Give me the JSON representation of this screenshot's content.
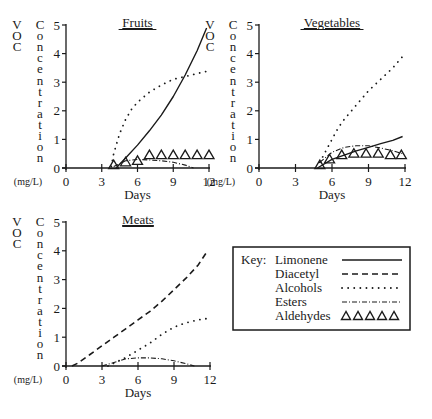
{
  "figure": {
    "ylabel_word1": [
      "V",
      "O",
      "C"
    ],
    "ylabel_word2": [
      "C",
      "o",
      "n",
      "c",
      "e",
      "n",
      "t",
      "r",
      "a",
      "t",
      "i",
      "o",
      "n"
    ],
    "ylabel_units": "(mg/L)",
    "xlabel": "Days",
    "y_ticks": [
      "0",
      "1",
      "2",
      "3",
      "4",
      "5"
    ],
    "x_ticks": [
      "0",
      "3",
      "6",
      "9",
      "12"
    ]
  },
  "legend": {
    "title": "Key:",
    "items": [
      {
        "label": "Limonene",
        "style": "solid"
      },
      {
        "label": "Diacetyl",
        "style": "dashed"
      },
      {
        "label": "Alcohols",
        "style": "dotted"
      },
      {
        "label": "Esters",
        "style": "dash-dot"
      },
      {
        "label": "Aldehydes",
        "style": "triangles"
      }
    ]
  },
  "chart_data": [
    {
      "type": "line",
      "title": "Fruits",
      "xlabel": "Days",
      "ylabel": "VOC Concentration (mg/L)",
      "xlim": [
        0,
        12
      ],
      "ylim": [
        0,
        5
      ],
      "x_ticks": [
        0,
        3,
        6,
        9,
        12
      ],
      "y_ticks": [
        0,
        1,
        2,
        3,
        4,
        5
      ],
      "series": [
        {
          "name": "Limonene",
          "x": [
            4.2,
            5,
            6,
            7,
            8,
            9,
            10,
            11,
            11.8
          ],
          "y": [
            0,
            0.35,
            0.8,
            1.3,
            1.85,
            2.5,
            3.25,
            4.1,
            4.9
          ]
        },
        {
          "name": "Alcohols",
          "x": [
            3.8,
            4,
            4.5,
            5,
            5.5,
            6,
            7,
            8,
            9,
            10,
            11,
            12
          ],
          "y": [
            0.05,
            0.5,
            1.2,
            1.7,
            2.05,
            2.3,
            2.65,
            2.9,
            3.1,
            3.2,
            3.3,
            3.4
          ]
        },
        {
          "name": "Esters",
          "x": [
            4,
            5,
            6,
            7,
            8,
            9,
            10,
            10.7
          ],
          "y": [
            0.05,
            0.25,
            0.3,
            0.28,
            0.25,
            0.2,
            0.1,
            0
          ]
        },
        {
          "name": "Aldehydes",
          "x": [
            4,
            5,
            6,
            7,
            8,
            9,
            10,
            11,
            12
          ],
          "y": [
            0.1,
            0.2,
            0.25,
            0.45,
            0.45,
            0.45,
            0.45,
            0.45,
            0.45
          ]
        }
      ]
    },
    {
      "type": "line",
      "title": "Vegetables",
      "xlabel": "Days",
      "ylabel": "VOC Concentration (mg/L)",
      "xlim": [
        0,
        12
      ],
      "ylim": [
        0,
        5
      ],
      "x_ticks": [
        0,
        3,
        6,
        9,
        12
      ],
      "y_ticks": [
        0,
        1,
        2,
        3,
        4,
        5
      ],
      "series": [
        {
          "name": "Limonene",
          "x": [
            4.8,
            6,
            7,
            8,
            9,
            10,
            11,
            11.8
          ],
          "y": [
            0,
            0.3,
            0.45,
            0.6,
            0.72,
            0.85,
            0.97,
            1.1
          ]
        },
        {
          "name": "Alcohols",
          "x": [
            5,
            5.5,
            6,
            6.5,
            7,
            8,
            9,
            10,
            11,
            11.8
          ],
          "y": [
            0.2,
            0.6,
            1.0,
            1.4,
            1.7,
            2.2,
            2.7,
            3.1,
            3.5,
            3.9
          ]
        },
        {
          "name": "Esters",
          "x": [
            5,
            6,
            7,
            8,
            9,
            10,
            11,
            11.8
          ],
          "y": [
            0.2,
            0.55,
            0.72,
            0.78,
            0.78,
            0.7,
            0.6,
            0.5
          ]
        },
        {
          "name": "Aldehydes",
          "x": [
            5,
            5.8,
            6.8,
            7.8,
            8.8,
            9.8,
            10.8,
            11.7
          ],
          "y": [
            0.1,
            0.3,
            0.45,
            0.5,
            0.5,
            0.5,
            0.45,
            0.45
          ]
        }
      ]
    },
    {
      "type": "line",
      "title": "Meats",
      "xlabel": "Days",
      "ylabel": "VOC Concentration (mg/L)",
      "xlim": [
        0,
        12
      ],
      "ylim": [
        0,
        5
      ],
      "x_ticks": [
        0,
        3,
        6,
        9,
        12
      ],
      "y_ticks": [
        0,
        1,
        2,
        3,
        4,
        5
      ],
      "series": [
        {
          "name": "Diacetyl",
          "x": [
            0.5,
            1,
            2,
            3,
            4,
            5,
            6,
            7,
            8,
            9,
            10,
            11,
            11.8
          ],
          "y": [
            0,
            0.1,
            0.4,
            0.7,
            1.0,
            1.3,
            1.6,
            1.9,
            2.25,
            2.65,
            3.05,
            3.5,
            4.0
          ]
        },
        {
          "name": "Alcohols",
          "x": [
            3.5,
            4,
            5,
            6,
            7,
            8,
            9,
            10,
            11,
            11.8
          ],
          "y": [
            0,
            0.1,
            0.3,
            0.55,
            0.8,
            1.1,
            1.35,
            1.5,
            1.6,
            1.65
          ]
        },
        {
          "name": "Esters",
          "x": [
            3,
            4,
            5,
            6,
            7,
            8,
            9,
            10,
            10.7
          ],
          "y": [
            0,
            0.12,
            0.25,
            0.28,
            0.28,
            0.25,
            0.18,
            0.08,
            0
          ]
        }
      ]
    }
  ]
}
